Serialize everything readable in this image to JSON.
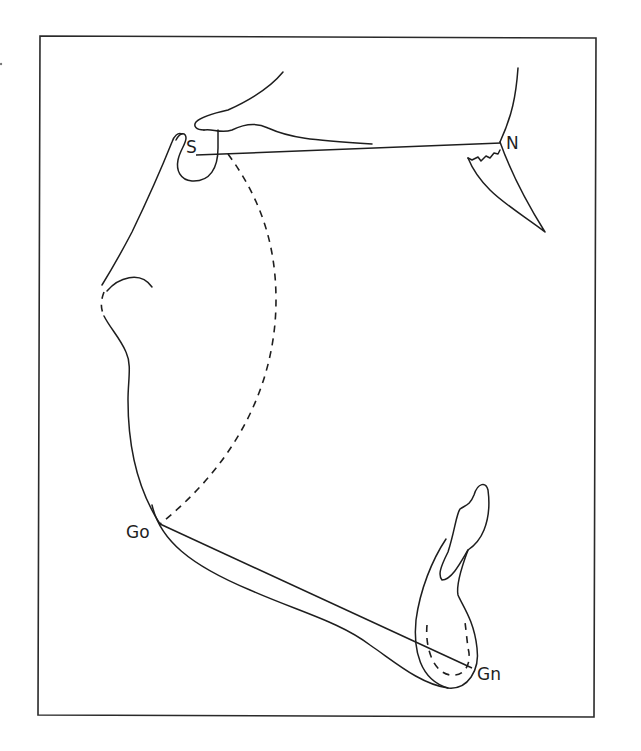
{
  "figure": {
    "type": "cephalometric-tracing",
    "colors": {
      "stroke": "#1e1e1e",
      "background": "#ffffff"
    },
    "landmarks": {
      "sella": {
        "label": "S"
      },
      "nasion": {
        "label": "N"
      },
      "gonion": {
        "label": "Go"
      },
      "gnathion": {
        "label": "Gn"
      }
    },
    "reference_lines": [
      {
        "name": "S-N line",
        "from": "S",
        "to": "N"
      },
      {
        "name": "Go-Gn line",
        "from": "Go",
        "to": "Gn"
      }
    ]
  }
}
